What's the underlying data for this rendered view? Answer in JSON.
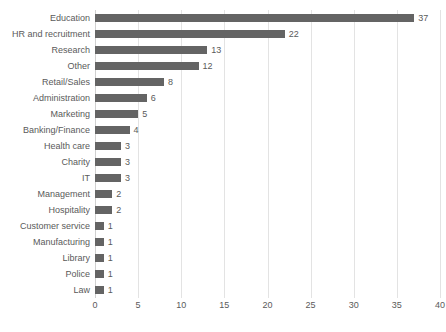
{
  "chart_data": {
    "type": "bar",
    "orientation": "horizontal",
    "title": "",
    "subtitle": "",
    "xlabel": "",
    "ylabel": "",
    "xlim": [
      0,
      40
    ],
    "xticks": [
      0,
      5,
      10,
      15,
      20,
      25,
      30,
      35,
      40
    ],
    "grid": true,
    "legend": false,
    "show_value_labels": true,
    "bar_color": "#646464",
    "text_color": "#5a5a5a",
    "gridline_color": "#e3e3e3",
    "background_color": "#ffffff",
    "categories": [
      "Education",
      "HR and recruitment",
      "Research",
      "Other",
      "Retail/Sales",
      "Administration",
      "Marketing",
      "Banking/Finance",
      "Health care",
      "Charity",
      "IT",
      "Management",
      "Hospitality",
      "Customer service",
      "Manufacturing",
      "Library",
      "Police",
      "Law"
    ],
    "values": [
      37,
      22,
      13,
      12,
      8,
      6,
      5,
      4,
      3,
      3,
      3,
      2,
      2,
      1,
      1,
      1,
      1,
      1
    ]
  }
}
